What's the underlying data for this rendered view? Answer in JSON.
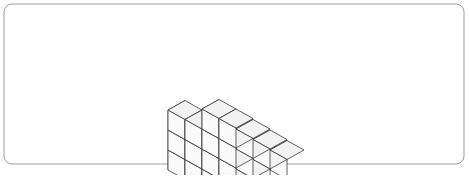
{
  "page": {
    "background_color": "#ffffff",
    "width": 469,
    "height": 175
  },
  "frame": {
    "name": "rounded-border-frame",
    "stroke_color": "#9a9a9a",
    "stroke_width": 1,
    "corner_radius": 8,
    "x": 4,
    "y": 4,
    "width": 460,
    "height": 160
  },
  "figure": {
    "name": "isometric-cube-stack",
    "origin_x": 236,
    "origin_y": 132,
    "tile_width": 17,
    "tile_height": 9.5,
    "cube_height": 20,
    "base_rows": 4,
    "base_cols": 4,
    "total_cubes": 34,
    "colors": {
      "top_face": "#f2f2f2",
      "left_face": "#e8e8e8",
      "right_face": "#fafafa",
      "edge_stroke": "#3b3b3b"
    },
    "height_map": [
      [
        1,
        1,
        1,
        1
      ],
      [
        1,
        2,
        2,
        2
      ],
      [
        2,
        2,
        3,
        3
      ],
      [
        3,
        3,
        4,
        4
      ]
    ]
  }
}
